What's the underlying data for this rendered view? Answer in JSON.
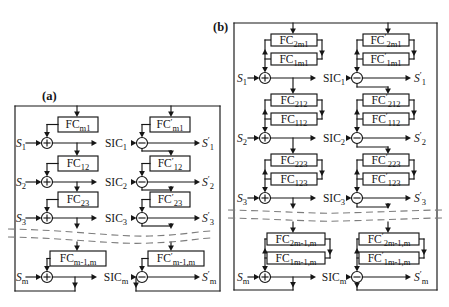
{
  "figure": {
    "background": "#ffffff",
    "line_color": "#161616",
    "dashed_color": "#7d7d7d",
    "prime_char": "′",
    "input_prefix": "S",
    "block_prefix": "FC",
    "sic_prefix": "SIC",
    "panels": [
      {
        "label": "(a)",
        "variant": "single-coupler",
        "rows": [
          {
            "input_sub": "1",
            "sic_sub": "1",
            "output_sub": "1",
            "left_blocks": [
              "m1"
            ],
            "right_blocks": [
              "m1"
            ]
          },
          {
            "input_sub": "2",
            "sic_sub": "2",
            "output_sub": "2",
            "left_blocks": [
              "12"
            ],
            "right_blocks": [
              "12"
            ]
          },
          {
            "input_sub": "3",
            "sic_sub": "3",
            "output_sub": "3",
            "left_blocks": [
              "23"
            ],
            "right_blocks": [
              "23"
            ]
          },
          {
            "input_sub": "m",
            "sic_sub": "m",
            "output_sub": "m",
            "left_blocks": [
              "m-1,m"
            ],
            "right_blocks": [
              "m-1,m"
            ]
          }
        ]
      },
      {
        "label": "(b)",
        "variant": "double-coupler",
        "rows": [
          {
            "input_sub": "1",
            "sic_sub": "1",
            "output_sub": "1",
            "left_blocks": [
              "2m1",
              "1m1"
            ],
            "right_blocks": [
              "2m1",
              "1m1"
            ]
          },
          {
            "input_sub": "2",
            "sic_sub": "2",
            "output_sub": "2",
            "left_blocks": [
              "212",
              "112"
            ],
            "right_blocks": [
              "212",
              "112"
            ]
          },
          {
            "input_sub": "3",
            "sic_sub": "3",
            "output_sub": "3",
            "left_blocks": [
              "223",
              "123"
            ],
            "right_blocks": [
              "223",
              "123"
            ]
          },
          {
            "input_sub": "m",
            "sic_sub": "m",
            "output_sub": "m",
            "left_blocks": [
              "2m-1,m",
              "1m-1,m"
            ],
            "right_blocks": [
              "2m-1,m",
              "1m-1,m"
            ]
          }
        ]
      }
    ]
  }
}
